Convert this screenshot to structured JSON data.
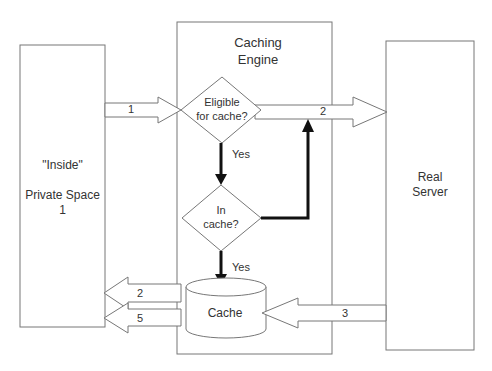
{
  "diagram": {
    "nodes": {
      "inside": {
        "line1": "\"Inside\"",
        "line2": "Private Space",
        "line3": "1"
      },
      "engine": {
        "line1": "Caching",
        "line2": "Engine"
      },
      "eligible": {
        "line1": "Eligible",
        "line2": "for cache?"
      },
      "incache": {
        "line1": "In",
        "line2": "cache?"
      },
      "cache": {
        "label": "Cache"
      },
      "server": {
        "line1": "Real",
        "line2": "Server"
      }
    },
    "edges": {
      "e1": "1",
      "e2_top": "2",
      "yes1": "Yes",
      "yes2": "Yes",
      "e2_back": "2",
      "e5_back": "5",
      "e3": "3"
    },
    "colors": {
      "stroke": "#555555",
      "thick": "#111111",
      "text": "#333333"
    }
  }
}
